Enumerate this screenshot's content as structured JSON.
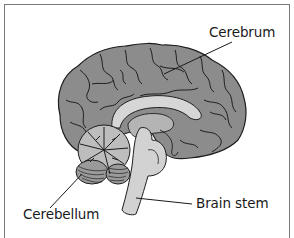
{
  "diagram": {
    "labels": [
      {
        "id": "cerebrum",
        "text": "Cerebrum"
      },
      {
        "id": "cerebellum",
        "text": "Cerebellum"
      },
      {
        "id": "brain-stem",
        "text": "Brain stem"
      }
    ],
    "colors": {
      "cortex": "#8c8c8c",
      "cortex_outline": "#1e1e1e",
      "inner_light": "#d6d6d6",
      "inner_mid": "#b4b4b4",
      "frame": "#7a7a7a",
      "text": "#1a1a1a"
    }
  }
}
